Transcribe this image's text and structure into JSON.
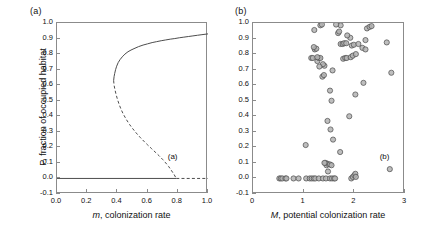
{
  "figure": {
    "panel_a_label": "(a)",
    "panel_b_label": "(b)",
    "inner_note_a": "(a)",
    "inner_note_b": "(b)"
  },
  "chart_data": [
    {
      "type": "line",
      "panel": "(a)",
      "title": "",
      "xlabel": "m, colonization rate",
      "xlabel_italic_part": "m",
      "xlabel_rest": ", colonization rate",
      "ylabel": "P, fraction of occupied habitat",
      "ylabel_italic_part": "P",
      "ylabel_rest": ", fraction of occupied habitat",
      "xlim": [
        0.0,
        1.0
      ],
      "ylim": [
        -0.1,
        1.0
      ],
      "xticks": [
        0.0,
        0.2,
        0.4,
        0.6,
        0.8,
        1.0
      ],
      "xtick_labels": [
        "0.0",
        "0.2",
        "0.4",
        "0.6",
        "0.8",
        "1.0"
      ],
      "yticks": [
        -0.1,
        0.0,
        0.1,
        0.2,
        0.3,
        0.4,
        0.5,
        0.6,
        0.7,
        0.8,
        0.9,
        1.0
      ],
      "ytick_labels": [
        "-0.1",
        "0.0",
        "0.1",
        "0.2",
        "0.3",
        "0.4",
        "0.5",
        "0.6",
        "0.7",
        "0.8",
        "0.9",
        "1.0"
      ],
      "grid": false,
      "legend": "none",
      "annotation": "(a)",
      "annotation_xy": [
        0.74,
        0.13
      ],
      "series": [
        {
          "name": "upper stable branch",
          "style": "solid",
          "x": [
            0.375,
            0.378,
            0.382,
            0.388,
            0.395,
            0.405,
            0.418,
            0.432,
            0.45,
            0.47,
            0.49,
            0.51,
            0.54,
            0.57,
            0.6,
            0.63,
            0.66,
            0.69,
            0.72,
            0.75,
            0.78,
            0.81,
            0.84,
            0.87,
            0.9,
            0.93,
            0.96,
            1.0
          ],
          "y": [
            0.63,
            0.655,
            0.675,
            0.7,
            0.722,
            0.745,
            0.765,
            0.782,
            0.8,
            0.815,
            0.826,
            0.835,
            0.848,
            0.858,
            0.866,
            0.874,
            0.88,
            0.886,
            0.891,
            0.896,
            0.9,
            0.905,
            0.909,
            0.913,
            0.917,
            0.921,
            0.925,
            0.93
          ]
        },
        {
          "name": "lower unstable branch",
          "style": "dashed",
          "x": [
            0.375,
            0.378,
            0.383,
            0.39,
            0.4,
            0.412,
            0.425,
            0.44,
            0.46,
            0.48,
            0.5,
            0.525,
            0.55,
            0.575,
            0.6,
            0.625,
            0.65,
            0.675,
            0.7,
            0.72,
            0.74,
            0.76,
            0.775,
            0.79
          ],
          "y": [
            0.63,
            0.6,
            0.575,
            0.545,
            0.51,
            0.475,
            0.443,
            0.412,
            0.378,
            0.348,
            0.322,
            0.292,
            0.265,
            0.24,
            0.216,
            0.193,
            0.17,
            0.147,
            0.122,
            0.1,
            0.076,
            0.048,
            0.026,
            0.0
          ]
        },
        {
          "name": "extinction equilibrium stable",
          "style": "solid",
          "x": [
            0.0,
            0.79
          ],
          "y": [
            0.0,
            0.0
          ]
        },
        {
          "name": "extinction equilibrium unstable",
          "style": "dashed",
          "x": [
            0.79,
            1.0
          ],
          "y": [
            0.0,
            0.0
          ]
        }
      ]
    },
    {
      "type": "scatter",
      "panel": "(b)",
      "title": "",
      "xlabel": "M, potential colonization rate",
      "xlabel_italic_part": "M",
      "xlabel_rest": ", potential colonization rate",
      "ylabel": "",
      "xlim": [
        0,
        3
      ],
      "ylim": [
        -0.1,
        1.0
      ],
      "xticks": [
        0,
        1,
        2,
        3
      ],
      "xtick_labels": [
        "0",
        "1",
        "2",
        "3"
      ],
      "yticks": [
        -0.1,
        0.0,
        0.1,
        0.2,
        0.3,
        0.4,
        0.5,
        0.6,
        0.7,
        0.8,
        0.9,
        1.0
      ],
      "ytick_labels": [
        "-0.1",
        "0.0",
        "0.1",
        "0.2",
        "0.3",
        "0.4",
        "0.5",
        "0.6",
        "0.7",
        "0.8",
        "0.9",
        "1.0"
      ],
      "grid": false,
      "legend": "none",
      "annotation": "(b)",
      "annotation_xy": [
        2.52,
        0.13
      ],
      "points": [
        [
          0.52,
          0.0
        ],
        [
          0.55,
          0.0
        ],
        [
          0.58,
          0.0
        ],
        [
          0.64,
          0.0
        ],
        [
          0.66,
          0.0
        ],
        [
          0.8,
          0.0
        ],
        [
          0.9,
          0.0
        ],
        [
          1.05,
          0.0
        ],
        [
          1.12,
          0.0
        ],
        [
          1.16,
          0.0
        ],
        [
          1.2,
          0.0
        ],
        [
          1.23,
          0.0
        ],
        [
          1.3,
          0.0
        ],
        [
          1.38,
          0.0
        ],
        [
          1.44,
          0.0
        ],
        [
          1.52,
          0.0
        ],
        [
          1.56,
          0.0
        ],
        [
          1.6,
          0.0
        ],
        [
          1.62,
          0.0
        ],
        [
          1.94,
          0.0
        ],
        [
          1.97,
          0.01
        ],
        [
          2.0,
          0.02
        ],
        [
          2.02,
          0.03
        ],
        [
          2.03,
          0.01
        ],
        [
          1.04,
          0.215
        ],
        [
          1.48,
          0.045
        ],
        [
          1.45,
          0.085
        ],
        [
          1.47,
          0.095
        ],
        [
          1.43,
          0.1
        ],
        [
          1.41,
          0.1
        ],
        [
          1.52,
          0.09
        ],
        [
          1.55,
          0.085
        ],
        [
          1.72,
          0.17
        ],
        [
          1.58,
          0.25
        ],
        [
          1.53,
          0.315
        ],
        [
          1.47,
          0.37
        ],
        [
          1.9,
          0.4
        ],
        [
          1.55,
          0.5
        ],
        [
          1.52,
          0.565
        ],
        [
          2.02,
          0.54
        ],
        [
          2.18,
          0.615
        ],
        [
          2.7,
          0.06
        ],
        [
          2.73,
          0.68
        ],
        [
          2.64,
          0.875
        ],
        [
          1.37,
          0.655
        ],
        [
          1.4,
          0.665
        ],
        [
          1.57,
          0.695
        ],
        [
          1.41,
          0.725
        ],
        [
          1.38,
          0.735
        ],
        [
          1.31,
          0.72
        ],
        [
          1.27,
          0.755
        ],
        [
          1.15,
          0.775
        ],
        [
          1.18,
          0.775
        ],
        [
          1.3,
          0.775
        ],
        [
          1.33,
          0.775
        ],
        [
          1.27,
          0.78
        ],
        [
          1.78,
          0.77
        ],
        [
          1.82,
          0.775
        ],
        [
          1.85,
          0.775
        ],
        [
          1.93,
          0.78
        ],
        [
          1.97,
          0.79
        ],
        [
          2.03,
          0.8
        ],
        [
          1.22,
          0.83
        ],
        [
          1.25,
          0.835
        ],
        [
          1.2,
          0.845
        ],
        [
          1.73,
          0.865
        ],
        [
          1.77,
          0.865
        ],
        [
          1.8,
          0.87
        ],
        [
          1.84,
          0.87
        ],
        [
          1.95,
          0.855
        ],
        [
          1.99,
          0.86
        ],
        [
          2.08,
          0.865
        ],
        [
          2.16,
          0.84
        ],
        [
          2.22,
          0.83
        ],
        [
          1.92,
          0.905
        ],
        [
          1.86,
          0.92
        ],
        [
          1.68,
          0.935
        ],
        [
          1.7,
          0.945
        ],
        [
          1.21,
          0.955
        ],
        [
          2.22,
          0.89
        ],
        [
          1.33,
          0.985
        ],
        [
          1.36,
          0.99
        ],
        [
          1.73,
          0.985
        ],
        [
          2.25,
          0.965
        ],
        [
          2.3,
          0.975
        ],
        [
          2.34,
          0.98
        ],
        [
          1.64,
          0.99
        ]
      ]
    }
  ]
}
